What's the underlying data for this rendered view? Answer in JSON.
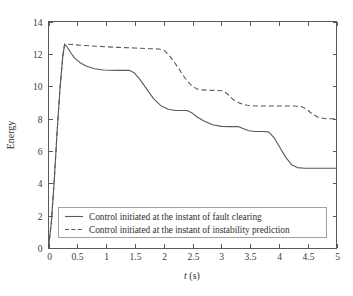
{
  "chart_data": {
    "type": "line",
    "title": "",
    "xlabel": "t (s)",
    "xlabel_italic_part": "t",
    "xlabel_rest": " (s)",
    "ylabel": "Energy",
    "xlim": [
      0,
      5
    ],
    "ylim": [
      0,
      14
    ],
    "xticks": [
      0,
      0.5,
      1,
      1.5,
      2,
      2.5,
      3,
      3.5,
      4,
      4.5,
      5
    ],
    "xtick_labels": [
      "0",
      "0.5",
      "1",
      "1.5",
      "2",
      "2.5",
      "3",
      "3.5",
      "4",
      "4.5",
      "5"
    ],
    "yticks": [
      0,
      2,
      4,
      6,
      8,
      10,
      12,
      14
    ],
    "ytick_labels": [
      "0",
      "2",
      "4",
      "6",
      "8",
      "10",
      "12",
      "14"
    ],
    "grid": false,
    "legend_position": "lower-center-inside",
    "line_color": "#595959",
    "series": [
      {
        "name": "Control initiated at the instant of fault clearing",
        "style": "solid",
        "points": [
          [
            0.0,
            0.0
          ],
          [
            0.05,
            1.6
          ],
          [
            0.1,
            4.2
          ],
          [
            0.15,
            7.2
          ],
          [
            0.2,
            9.9
          ],
          [
            0.25,
            11.9
          ],
          [
            0.28,
            12.6
          ],
          [
            0.32,
            12.45
          ],
          [
            0.38,
            12.1
          ],
          [
            0.45,
            11.75
          ],
          [
            0.55,
            11.45
          ],
          [
            0.65,
            11.25
          ],
          [
            0.8,
            11.08
          ],
          [
            0.95,
            11.0
          ],
          [
            1.2,
            10.98
          ],
          [
            1.4,
            10.98
          ],
          [
            1.48,
            10.85
          ],
          [
            1.58,
            10.45
          ],
          [
            1.7,
            9.85
          ],
          [
            1.82,
            9.25
          ],
          [
            1.95,
            8.8
          ],
          [
            2.08,
            8.58
          ],
          [
            2.2,
            8.5
          ],
          [
            2.4,
            8.5
          ],
          [
            2.48,
            8.38
          ],
          [
            2.58,
            8.1
          ],
          [
            2.7,
            7.85
          ],
          [
            2.85,
            7.62
          ],
          [
            3.0,
            7.52
          ],
          [
            3.15,
            7.5
          ],
          [
            3.3,
            7.5
          ],
          [
            3.38,
            7.38
          ],
          [
            3.48,
            7.25
          ],
          [
            3.58,
            7.2
          ],
          [
            3.72,
            7.2
          ],
          [
            3.82,
            7.18
          ],
          [
            3.92,
            6.8
          ],
          [
            4.02,
            6.2
          ],
          [
            4.12,
            5.6
          ],
          [
            4.22,
            5.15
          ],
          [
            4.32,
            4.97
          ],
          [
            4.45,
            4.93
          ],
          [
            4.7,
            4.93
          ],
          [
            5.0,
            4.93
          ]
        ]
      },
      {
        "name": "Control initiated at the instant of instability prediction",
        "style": "dashed",
        "points": [
          [
            0.0,
            0.0
          ],
          [
            0.05,
            1.6
          ],
          [
            0.1,
            4.2
          ],
          [
            0.15,
            7.2
          ],
          [
            0.2,
            9.9
          ],
          [
            0.25,
            11.9
          ],
          [
            0.28,
            12.6
          ],
          [
            0.4,
            12.58
          ],
          [
            0.6,
            12.52
          ],
          [
            0.9,
            12.46
          ],
          [
            1.2,
            12.4
          ],
          [
            1.5,
            12.36
          ],
          [
            1.75,
            12.32
          ],
          [
            1.92,
            12.3
          ],
          [
            2.02,
            12.18
          ],
          [
            2.12,
            11.8
          ],
          [
            2.24,
            11.2
          ],
          [
            2.36,
            10.55
          ],
          [
            2.48,
            10.05
          ],
          [
            2.58,
            9.82
          ],
          [
            2.7,
            9.76
          ],
          [
            2.9,
            9.74
          ],
          [
            3.02,
            9.72
          ],
          [
            3.1,
            9.55
          ],
          [
            3.2,
            9.2
          ],
          [
            3.32,
            8.95
          ],
          [
            3.45,
            8.82
          ],
          [
            3.6,
            8.78
          ],
          [
            3.9,
            8.78
          ],
          [
            4.2,
            8.78
          ],
          [
            4.38,
            8.76
          ],
          [
            4.48,
            8.58
          ],
          [
            4.58,
            8.28
          ],
          [
            4.68,
            8.08
          ],
          [
            4.8,
            8.0
          ],
          [
            4.9,
            7.99
          ],
          [
            5.0,
            7.99
          ]
        ]
      }
    ],
    "legend_entries": [
      {
        "label": "Control initiated at the instant of fault clearing",
        "style": "solid"
      },
      {
        "label": "Control initiated at the instant of instability prediction",
        "style": "dashed"
      }
    ]
  }
}
